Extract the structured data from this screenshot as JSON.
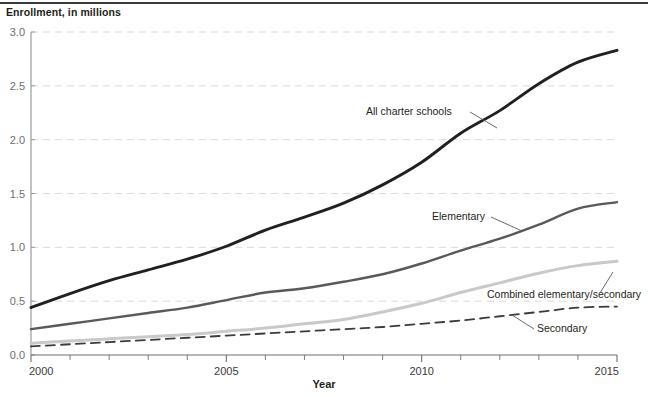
{
  "axis_label_y": "Enrollment, in millions",
  "axis_label_x": "Year",
  "y_ticks": [
    "0.0",
    "0.5",
    "1.0",
    "1.5",
    "2.0",
    "2.5",
    "3.0"
  ],
  "x_ticks": [
    "2000",
    "2005",
    "2010",
    "2015"
  ],
  "series_labels": {
    "all": "All charter schools",
    "elementary": "Elementary",
    "combined": "Combined elementary/secondary",
    "secondary": "Secondary"
  },
  "colors": {
    "all_charter": "#231f20",
    "elementary": "#58595b",
    "combined": "#c9c9c9",
    "secondary": "#3b3b3b",
    "gridline": "#d6d6d6",
    "axis": "#808080"
  },
  "chart_data": {
    "type": "line",
    "title": "",
    "xlabel": "Year",
    "ylabel": "Enrollment, in millions",
    "xlim": [
      2000,
      2015
    ],
    "ylim": [
      0.0,
      3.0
    ],
    "ytick_values": [
      0.0,
      0.5,
      1.0,
      1.5,
      2.0,
      2.5,
      3.0
    ],
    "xtick_values": [
      2000,
      2005,
      2010,
      2015
    ],
    "xtick_minor_step": 1,
    "grid": "horizontal-dashed",
    "legend": "inline-annotations",
    "x": [
      2000,
      2001,
      2002,
      2003,
      2004,
      2005,
      2006,
      2007,
      2008,
      2009,
      2010,
      2011,
      2012,
      2013,
      2014,
      2015
    ],
    "series": [
      {
        "name": "All charter schools",
        "style": "solid",
        "color": "#231f20",
        "values": [
          0.44,
          0.57,
          0.69,
          0.79,
          0.89,
          1.01,
          1.16,
          1.28,
          1.41,
          1.58,
          1.79,
          2.06,
          2.27,
          2.52,
          2.72,
          2.83
        ]
      },
      {
        "name": "Elementary",
        "style": "solid",
        "color": "#58595b",
        "values": [
          0.24,
          0.29,
          0.34,
          0.39,
          0.44,
          0.51,
          0.58,
          0.62,
          0.68,
          0.75,
          0.85,
          0.97,
          1.08,
          1.21,
          1.36,
          1.42
        ]
      },
      {
        "name": "Combined elementary/secondary",
        "style": "solid",
        "color": "#c9c9c9",
        "values": [
          0.11,
          0.13,
          0.15,
          0.17,
          0.19,
          0.22,
          0.25,
          0.29,
          0.33,
          0.4,
          0.48,
          0.58,
          0.67,
          0.76,
          0.83,
          0.87
        ]
      },
      {
        "name": "Secondary",
        "style": "dashed",
        "color": "#3b3b3b",
        "values": [
          0.08,
          0.1,
          0.12,
          0.14,
          0.16,
          0.18,
          0.2,
          0.22,
          0.24,
          0.26,
          0.29,
          0.32,
          0.36,
          0.4,
          0.44,
          0.45
        ]
      }
    ]
  }
}
